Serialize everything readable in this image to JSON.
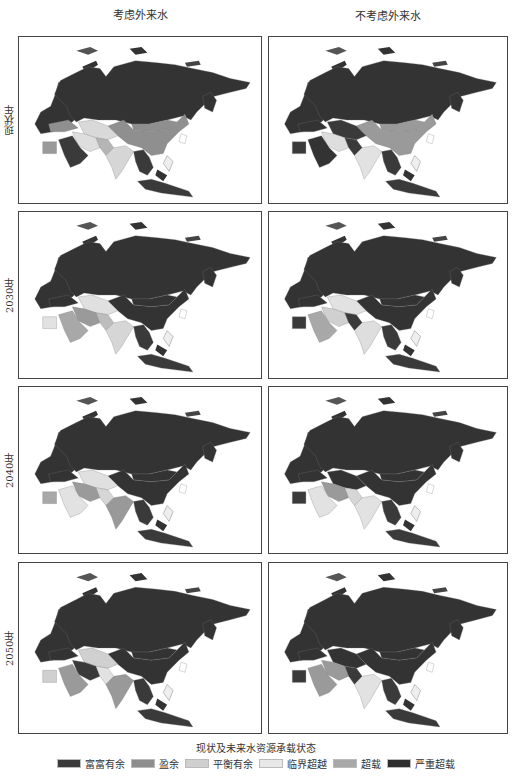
{
  "columns": [
    {
      "title": "考虑外来水"
    },
    {
      "title": "不考虑外来水"
    }
  ],
  "rows": [
    {
      "label": "现状年"
    },
    {
      "label": "2030年"
    },
    {
      "label": "2040年"
    },
    {
      "label": "2050年"
    }
  ],
  "legend": {
    "title": "现状及未来水资源承载状态",
    "items": [
      {
        "label": "富富有余",
        "color": "#3a3a3a"
      },
      {
        "label": "盈余",
        "color": "#8e8e8e"
      },
      {
        "label": "平衡有余",
        "color": "#cfcfcf"
      },
      {
        "label": "临界超越",
        "color": "#e8e8e8"
      },
      {
        "label": "超载",
        "color": "#a8a8a8"
      },
      {
        "label": "严重超载",
        "color": "#2e2e2e"
      }
    ]
  },
  "panels": [
    {
      "row": 0,
      "col": 0,
      "regions": {
        "russia": "#333333",
        "china": "#8f8f8f",
        "mongolia": "#8f8f8f",
        "central_asia": "#d9d9d9",
        "iran": "#dedede",
        "arabia": "#3a3a3a",
        "egypt": "#9a9a9a",
        "turkey": "#8f8f8f",
        "india": "#d6d6d6",
        "pakistan": "#b5b5b5",
        "se_asia": "#3a3a3a",
        "indonesia": "#3a3a3a",
        "japan": "#333333",
        "korea": "#ffffff",
        "europe": "#333333"
      }
    },
    {
      "row": 0,
      "col": 1,
      "regions": {
        "russia": "#333333",
        "china": "#9a9a9a",
        "mongolia": "#9a9a9a",
        "central_asia": "#3a3a3a",
        "iran": "#dedede",
        "arabia": "#333333",
        "egypt": "#3a3a3a",
        "turkey": "#333333",
        "india": "#e2e2e2",
        "pakistan": "#3a3a3a",
        "se_asia": "#3a3a3a",
        "indonesia": "#3a3a3a",
        "japan": "#333333",
        "korea": "#ffffff",
        "europe": "#333333"
      }
    },
    {
      "row": 1,
      "col": 0,
      "regions": {
        "russia": "#333333",
        "china": "#333333",
        "mongolia": "#333333",
        "central_asia": "#e0e0e0",
        "iran": "#9a9a9a",
        "arabia": "#a8a8a8",
        "egypt": "#e2e2e2",
        "turkey": "#333333",
        "india": "#d6d6d6",
        "pakistan": "#bdbdbd",
        "se_asia": "#3a3a3a",
        "indonesia": "#3a3a3a",
        "japan": "#333333",
        "korea": "#ffffff",
        "europe": "#333333"
      }
    },
    {
      "row": 1,
      "col": 1,
      "regions": {
        "russia": "#333333",
        "china": "#333333",
        "mongolia": "#333333",
        "central_asia": "#e2e2e2",
        "iran": "#d0d0d0",
        "arabia": "#a8a8a8",
        "egypt": "#3a3a3a",
        "turkey": "#333333",
        "india": "#dedede",
        "pakistan": "#3a3a3a",
        "se_asia": "#3a3a3a",
        "indonesia": "#3a3a3a",
        "japan": "#333333",
        "korea": "#ffffff",
        "europe": "#333333"
      }
    },
    {
      "row": 2,
      "col": 0,
      "regions": {
        "russia": "#333333",
        "china": "#333333",
        "mongolia": "#333333",
        "central_asia": "#e0e0e0",
        "iran": "#9a9a9a",
        "arabia": "#e2e2e2",
        "egypt": "#a8a8a8",
        "turkey": "#333333",
        "india": "#999999",
        "pakistan": "#d6d6d6",
        "se_asia": "#3a3a3a",
        "indonesia": "#3a3a3a",
        "japan": "#333333",
        "korea": "#ffffff",
        "europe": "#333333"
      }
    },
    {
      "row": 2,
      "col": 1,
      "regions": {
        "russia": "#333333",
        "china": "#333333",
        "mongolia": "#333333",
        "central_asia": "#333333",
        "iran": "#9a9a9a",
        "arabia": "#e2e2e2",
        "egypt": "#3a3a3a",
        "turkey": "#333333",
        "india": "#e2e2e2",
        "pakistan": "#d6d6d6",
        "se_asia": "#3a3a3a",
        "indonesia": "#3a3a3a",
        "japan": "#333333",
        "korea": "#ffffff",
        "europe": "#333333"
      }
    },
    {
      "row": 3,
      "col": 0,
      "regions": {
        "russia": "#333333",
        "china": "#333333",
        "mongolia": "#333333",
        "central_asia": "#d0d0d0",
        "iran": "#3a3a3a",
        "arabia": "#9a9a9a",
        "egypt": "#d0d0d0",
        "turkey": "#333333",
        "india": "#999999",
        "pakistan": "#e2e2e2",
        "se_asia": "#3a3a3a",
        "indonesia": "#3a3a3a",
        "japan": "#333333",
        "korea": "#ffffff",
        "europe": "#333333"
      }
    },
    {
      "row": 3,
      "col": 1,
      "regions": {
        "russia": "#333333",
        "china": "#333333",
        "mongolia": "#333333",
        "central_asia": "#333333",
        "iran": "#9a9a9a",
        "arabia": "#9a9a9a",
        "egypt": "#3a3a3a",
        "turkey": "#333333",
        "india": "#e2e2e2",
        "pakistan": "#3a3a3a",
        "se_asia": "#3a3a3a",
        "indonesia": "#3a3a3a",
        "japan": "#333333",
        "korea": "#ffffff",
        "europe": "#333333"
      }
    }
  ]
}
